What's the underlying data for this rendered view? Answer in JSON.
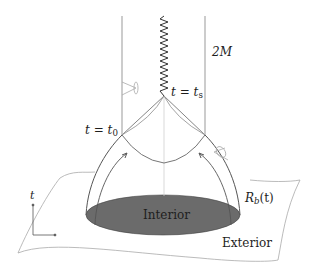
{
  "diagram": {
    "type": "spacetime-collapse-diagram",
    "labels": {
      "horizon_radius": "2M",
      "singularity_time": {
        "var": "t",
        "eq": "=",
        "base": "t",
        "sub": "s"
      },
      "initial_time": {
        "var": "t",
        "eq": "=",
        "base": "t",
        "sub": "0"
      },
      "boundary": {
        "base": "R",
        "sub": "b",
        "arg": "(t)"
      },
      "interior": "Interior",
      "exterior": "Exterior",
      "time_axis": "t"
    },
    "colors": {
      "line": "#555555",
      "light_line": "#aaaaaa",
      "interior_fill": "#6b6b6b",
      "text": "#1e1e1e",
      "background": "#ffffff"
    },
    "elements": [
      "event-horizon-cylinder",
      "singularity-zigzag",
      "light-cones",
      "collapsing-star-surface",
      "trapped-surface-arrows",
      "initial-hypersurface",
      "interior-disk",
      "time-axis-indicator"
    ]
  }
}
